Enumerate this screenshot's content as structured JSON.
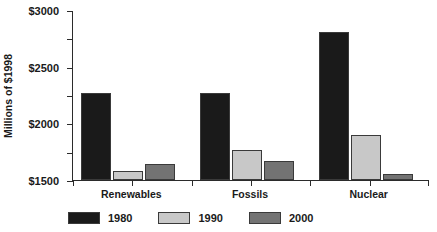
{
  "chart_data": {
    "type": "bar",
    "title": "",
    "xlabel": "",
    "ylabel": "Millions of $1998",
    "categories": [
      "Renewables",
      "Fossils",
      "Nuclear"
    ],
    "series": [
      {
        "name": "1980",
        "color": "#1a1a1a",
        "values": [
          1540,
          1540,
          2610
        ]
      },
      {
        "name": "1990",
        "color": "#c8c8c8",
        "values": [
          160,
          525,
          790
        ]
      },
      {
        "name": "2000",
        "color": "#737373",
        "values": [
          275,
          335,
          110
        ]
      }
    ],
    "ylim": [
      0,
      3000
    ],
    "yticks": [
      0,
      500,
      1000,
      1500,
      2000,
      2500,
      3000
    ],
    "ytick_labels": [
      "S0",
      "$500",
      "$1000",
      "$1500",
      "$2000",
      "$2500",
      "$3000"
    ],
    "grid": false,
    "legend_position": "bottom"
  },
  "axis": {
    "y_title": "Millions of $1998"
  },
  "legend": {
    "items": [
      {
        "label": "1980",
        "color": "#1a1a1a"
      },
      {
        "label": "1990",
        "color": "#c8c8c8"
      },
      {
        "label": "2000",
        "color": "#737373"
      }
    ]
  },
  "colors": {
    "series_1980": "#1a1a1a",
    "series_1990": "#c8c8c8",
    "series_2000": "#737373",
    "axis": "#2b2b2b",
    "background": "#ffffff",
    "text": "#1a1a1a"
  }
}
